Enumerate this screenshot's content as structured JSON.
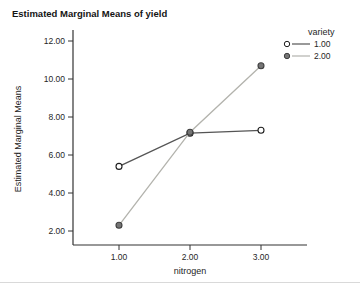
{
  "chart_data": {
    "type": "line",
    "title": "Estimated Marginal Means of yield",
    "xlabel": "nitrogen",
    "ylabel": "Estimated Marginal Means",
    "x": [
      1.0,
      2.0,
      3.0
    ],
    "x_tick_labels": [
      "1.00",
      "2.00",
      "3.00"
    ],
    "y_ticks": [
      2,
      4,
      6,
      8,
      10,
      12
    ],
    "y_tick_labels": [
      "2.00",
      "4.00",
      "6.00",
      "8.00",
      "10.00",
      "12.00"
    ],
    "xlim": [
      0.35,
      3.65
    ],
    "ylim": [
      1.3,
      12.6
    ],
    "grid": false,
    "legend_title": "variety",
    "legend_position": "top-right",
    "axis_color": "#333333",
    "text_color": "#262626",
    "series": [
      {
        "name": "1.00",
        "values": [
          5.4,
          7.15,
          7.3
        ],
        "line_color": "#555555",
        "marker": "open-circle",
        "marker_fill": "#ffffff",
        "marker_stroke": "#1f1f1f"
      },
      {
        "name": "2.00",
        "values": [
          2.3,
          7.2,
          10.7
        ],
        "line_color": "#b3b3ad",
        "marker": "filled-circle",
        "marker_fill": "#757575",
        "marker_stroke": "#3f3f3f"
      }
    ]
  }
}
